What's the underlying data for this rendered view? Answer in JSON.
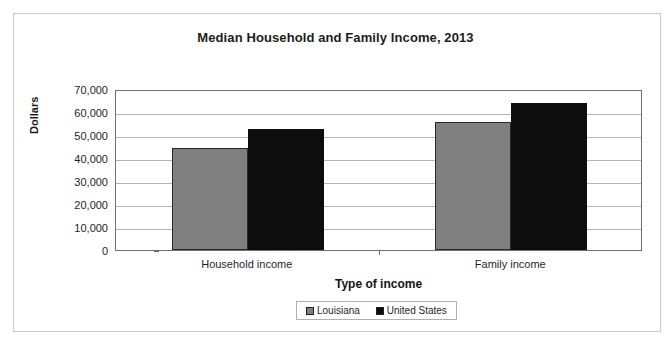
{
  "chart_data": {
    "type": "bar",
    "title": "Median Household and Family Income, 2013",
    "xlabel": "Type of income",
    "ylabel": "Dollars",
    "categories": [
      "Household income",
      "Family income"
    ],
    "series": [
      {
        "name": "Louisiana",
        "color": "#808080",
        "values": [
          44500,
          55500
        ]
      },
      {
        "name": "United States",
        "color": "#0d0d0d",
        "values": [
          52500,
          64000
        ]
      }
    ],
    "ylim": [
      0,
      70000
    ],
    "ytick_values": [
      70000,
      60000,
      50000,
      40000,
      30000,
      20000,
      10000,
      0
    ],
    "ytick_labels": [
      "70,000",
      "60,000",
      "50,000",
      "40,000",
      "30,000",
      "20,000",
      "10,000",
      "0"
    ],
    "grid": true,
    "legend_position": "bottom"
  }
}
